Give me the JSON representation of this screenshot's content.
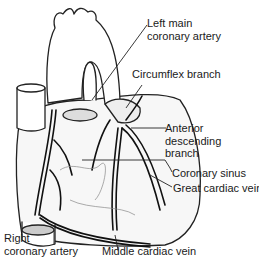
{
  "diagram": {
    "labels": [
      {
        "id": "left-main",
        "line1": "Left main",
        "line2": "coronary artery"
      },
      {
        "id": "circumflex",
        "line1": "Circumflex branch"
      },
      {
        "id": "anterior-descending",
        "line1": "Anterior",
        "line2": "descending",
        "line3": "branch"
      },
      {
        "id": "coronary-sinus",
        "line1": "Coronary sinus"
      },
      {
        "id": "great-cardiac-vein",
        "line1": "Great cardiac vein"
      },
      {
        "id": "right-coronary",
        "line1": "Right",
        "line2": "coronary artery"
      },
      {
        "id": "middle-cardiac-vein",
        "line1": "Middle cardiac vein"
      }
    ]
  }
}
